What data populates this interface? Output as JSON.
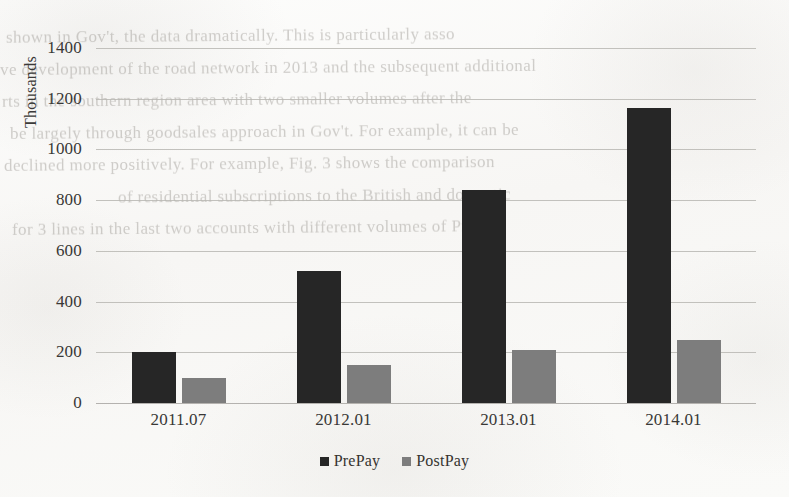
{
  "chart_data": {
    "type": "bar",
    "title": "",
    "xlabel": "",
    "ylabel": "Thousands",
    "categories": [
      "2011.07",
      "2012.01",
      "2013.01",
      "2014.01"
    ],
    "series": [
      {
        "name": "PrePay",
        "color": "#262626",
        "values": [
          200,
          520,
          840,
          1165
        ]
      },
      {
        "name": "PostPay",
        "color": "#7d7d7d",
        "values": [
          100,
          150,
          210,
          250
        ]
      }
    ],
    "ylim": [
      0,
      1400
    ],
    "ytick_step": 200,
    "yticks": [
      0,
      200,
      400,
      600,
      800,
      1000,
      1200,
      1400
    ],
    "ytick_labels": [
      "0",
      "200",
      "400",
      "600",
      "800",
      "1000",
      "1200",
      "1400"
    ],
    "grid": true,
    "legend_position": "bottom"
  },
  "legend": {
    "items": [
      {
        "label": "PrePay",
        "swatch": "prepay-legend-swatch"
      },
      {
        "label": "PostPay",
        "swatch": "postpay-legend-swatch"
      }
    ]
  },
  "background_text": {
    "note": "faint bleed-through text from reverse of scanned page",
    "lines": [
      "shown in Gov't, the data dramatically. This is particularly asso",
      "ve development of the road network in 2013 and the subsequent additional",
      "rts in the southern region area with two smaller volumes after the",
      "be largely through goodsales approach in Gov't. For example, it can be",
      "declined more positively. For example, Fig. 3 shows the comparison",
      "of residential subscriptions to the British and domestic",
      "for 3 lines in the last two accounts with different volumes of PrePay."
    ]
  }
}
